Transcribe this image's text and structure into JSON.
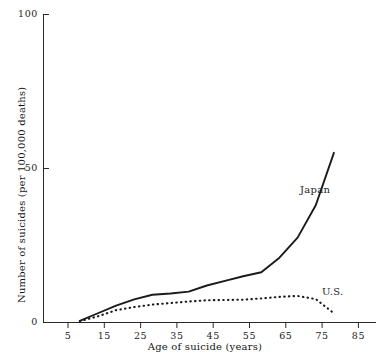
{
  "chart_data": {
    "type": "line",
    "title": "",
    "xlabel": "Age of suicide (years)",
    "ylabel": "Number of suicides (per 100,000 deaths)",
    "xlim": [
      0,
      90
    ],
    "ylim": [
      0,
      100
    ],
    "xticks": [
      5,
      15,
      25,
      35,
      45,
      55,
      65,
      75,
      85
    ],
    "xtick_labels": [
      "5",
      "15",
      "25",
      "35",
      "45",
      "55",
      "65",
      "75",
      "85"
    ],
    "yticks": [
      0,
      50,
      100
    ],
    "ytick_labels": [
      "0",
      "50",
      "100"
    ],
    "grid": false,
    "legend_position": "inline-annotation",
    "series": [
      {
        "name": "Japan",
        "style": "solid",
        "color": "#1a1a1a",
        "label_text": "Japan",
        "x": [
          10,
          15,
          20,
          25,
          30,
          35,
          40,
          45,
          50,
          55,
          60,
          65,
          70,
          75,
          80
        ],
        "values": [
          0.5,
          3.0,
          5.5,
          7.5,
          9.0,
          9.4,
          10.0,
          12.0,
          13.5,
          15.0,
          16.3,
          21.0,
          27.5,
          38.0,
          55.0
        ]
      },
      {
        "name": "U.S.",
        "style": "dotted",
        "color": "#1a1a1a",
        "label_text": "U.S.",
        "x": [
          10,
          15,
          20,
          25,
          30,
          35,
          40,
          45,
          50,
          55,
          60,
          65,
          70,
          75,
          80
        ],
        "values": [
          0.4,
          2.0,
          4.0,
          5.0,
          5.8,
          6.3,
          6.8,
          7.2,
          7.3,
          7.4,
          7.8,
          8.3,
          8.6,
          7.6,
          3.0
        ]
      }
    ]
  },
  "axes": {
    "y_tick_100": "100",
    "y_tick_50": "50",
    "y_tick_0": "0",
    "x_tick_5": "5",
    "x_tick_15": "15",
    "x_tick_25": "25",
    "x_tick_35": "35",
    "x_tick_45": "45",
    "x_tick_55": "55",
    "x_tick_65": "65",
    "x_tick_75": "75",
    "x_tick_85": "85",
    "x_title": "Age of suicide (years)",
    "y_title": "Number of suicides (per 100,000 deaths)"
  },
  "annotations": {
    "japan_label": "Japan",
    "us_label": "U.S."
  },
  "colors": {
    "ink": "#1a1a1a",
    "axis": "#2a2a2a",
    "background": "#ffffff"
  }
}
